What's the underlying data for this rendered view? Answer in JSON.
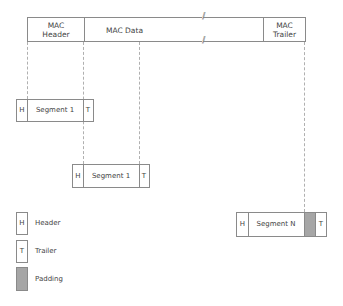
{
  "mac_frame": {
    "header_label": "MAC\nHeader",
    "header_line1": "MAC",
    "header_line2": "Header",
    "data_label": "MAC Data",
    "trailer_line1": "MAC",
    "trailer_line2": "Trailer",
    "break_mark": "//"
  },
  "segments": [
    {
      "h": "H",
      "label": "Segment 1",
      "t": "T"
    },
    {
      "h": "H",
      "label": "Segment 1",
      "t": "T"
    },
    {
      "h": "H",
      "label": "Segment N",
      "t": "T"
    }
  ],
  "legend": [
    {
      "symbol": "H",
      "label": "Header"
    },
    {
      "symbol": "T",
      "label": "Trailer"
    },
    {
      "symbol": "",
      "label": "Padding"
    }
  ],
  "colors": {
    "border": "#8a8a8a",
    "padding": "#a6a6a6",
    "dash": "#b0b0b0"
  }
}
